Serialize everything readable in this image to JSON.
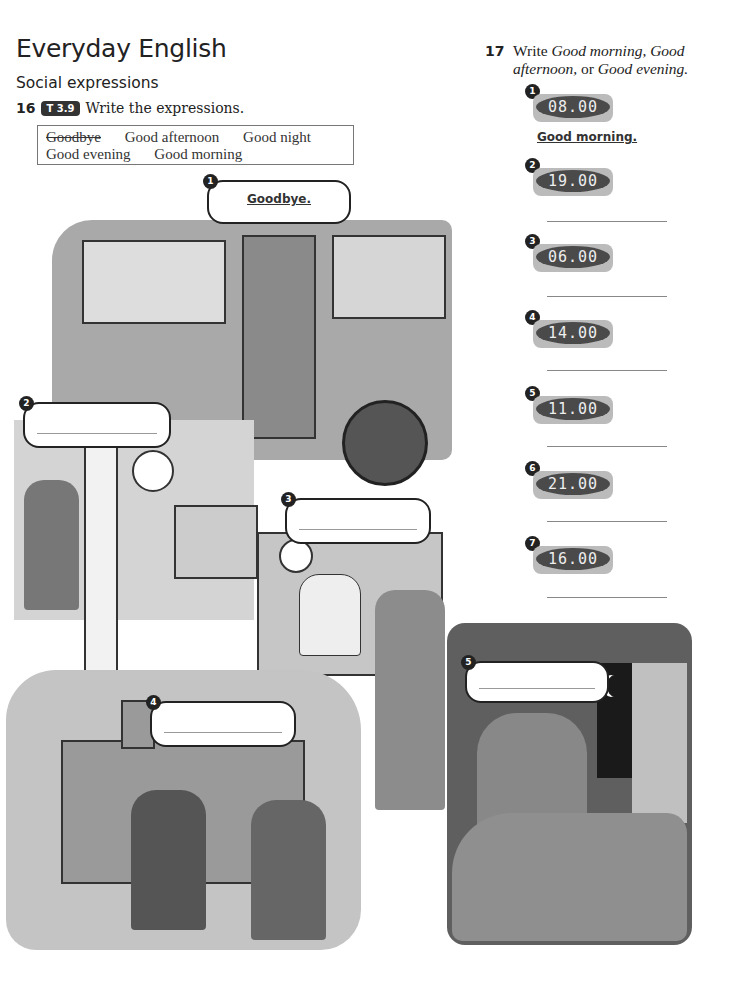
{
  "header": {
    "title": "Everyday English",
    "subtitle": "Social expressions"
  },
  "exercise16": {
    "number": "16",
    "track": "T 3.9",
    "instruction": "Write the expressions.",
    "word_box": [
      {
        "text": "Goodbye",
        "struck": true
      },
      {
        "text": "Good afternoon",
        "struck": false
      },
      {
        "text": "Good night",
        "struck": false
      },
      {
        "text": "Good evening",
        "struck": false
      },
      {
        "text": "Good morning",
        "struck": false
      }
    ],
    "pictures": [
      {
        "number": "1",
        "answer": "Goodbye.",
        "scene": "bus"
      },
      {
        "number": "2",
        "answer": "",
        "scene": "office"
      },
      {
        "number": "3",
        "answer": "",
        "scene": "reception desk"
      },
      {
        "number": "4",
        "answer": "",
        "scene": "town hall handshake"
      },
      {
        "number": "5",
        "answer": "",
        "scene": "bedtime"
      }
    ]
  },
  "exercise17": {
    "number": "17",
    "instruction_prefix": "Write ",
    "opt1": "Good morning, Good afternoon,",
    "connector": " or ",
    "opt2": "Good evening.",
    "items": [
      {
        "number": "1",
        "time": "08.00",
        "answer": "Good morning."
      },
      {
        "number": "2",
        "time": "19.00",
        "answer": ""
      },
      {
        "number": "3",
        "time": "06.00",
        "answer": ""
      },
      {
        "number": "4",
        "time": "14.00",
        "answer": ""
      },
      {
        "number": "5",
        "time": "11.00",
        "answer": ""
      },
      {
        "number": "6",
        "time": "21.00",
        "answer": ""
      },
      {
        "number": "7",
        "time": "16.00",
        "answer": ""
      }
    ]
  }
}
